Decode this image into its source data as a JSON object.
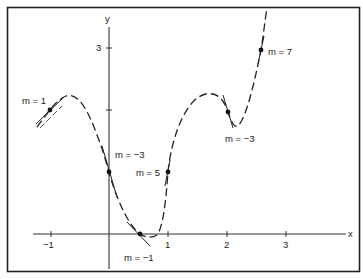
{
  "diagram": {
    "title": "",
    "axes": {
      "x_label": "x",
      "y_label": "y",
      "x_ticks": [
        "−1",
        "1",
        "2",
        "3"
      ],
      "y_ticks": [
        "3"
      ],
      "x_range": [
        -1.3,
        4.1
      ],
      "y_range": [
        -0.55,
        3.65
      ]
    },
    "curve": {
      "style": "dashed",
      "description": "graph of a function with tangent lines drawn at several points, each labeled with its slope m"
    },
    "tangents": [
      {
        "label": "m = 1",
        "slope": 1,
        "point": [
          -0.9,
          1.95
        ]
      },
      {
        "label": "m = −3",
        "slope": -3,
        "point": [
          0.0,
          1.0
        ]
      },
      {
        "label": "m = −1",
        "slope": -1,
        "point": [
          0.53,
          0.0
        ]
      },
      {
        "label": "m = 5",
        "slope": 5,
        "point": [
          1.0,
          1.0
        ]
      },
      {
        "label": "m = −3",
        "slope": -3,
        "point": [
          2.02,
          1.97
        ]
      },
      {
        "label": "m = 7",
        "slope": 7,
        "point": [
          2.58,
          3.0
        ]
      }
    ],
    "colors": {
      "ink": "#222222",
      "background": "#ffffff"
    }
  }
}
